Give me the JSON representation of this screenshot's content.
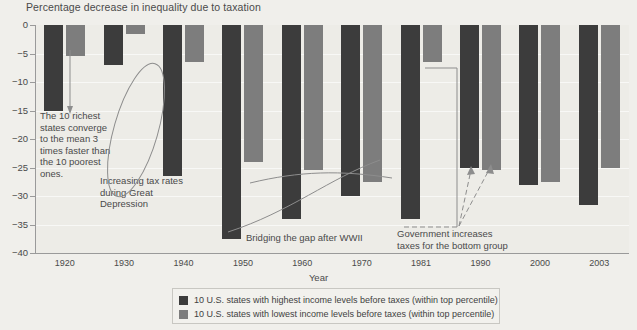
{
  "chart_data": {
    "type": "bar",
    "title": "Percentage decrease in inequality due to taxation",
    "xlabel": "Year",
    "ylabel": "",
    "ylim": [
      -40,
      0
    ],
    "yticks": [
      "0",
      "−5",
      "−10",
      "−15",
      "−20",
      "−25",
      "−30",
      "−35",
      "−40"
    ],
    "ytick_values": [
      0,
      -5,
      -10,
      -15,
      -20,
      -25,
      -30,
      -35,
      -40
    ],
    "grid": true,
    "legend_position": "bottom-center",
    "categories": [
      "1920",
      "1930",
      "1940",
      "1950",
      "1960",
      "1970",
      "1981",
      "1990",
      "2000",
      "2003"
    ],
    "series": [
      {
        "name": "10 U.S. states with highest income levels before taxes (within top percentile)",
        "color": "#3c3c3c",
        "values": [
          -15.0,
          -7.0,
          -26.5,
          -37.5,
          -34.0,
          -30.0,
          -34.0,
          -25.0,
          -28.0,
          -31.5
        ]
      },
      {
        "name": "10 U.S. states with lowest income levels before taxes (within top percentile)",
        "color": "#7d7d7d",
        "values": [
          -5.5,
          -1.5,
          -6.5,
          -24.0,
          -25.5,
          -27.5,
          -6.5,
          -25.5,
          -27.5,
          -25.0
        ]
      }
    ],
    "annotations": [
      {
        "id": "richest-converge",
        "text": "The 10 richest states converge to the mean 3 times faster than the 10 poorest ones."
      },
      {
        "id": "great-depression",
        "text": "Increasing tax rates during Great Depression"
      },
      {
        "id": "bridging-gap",
        "text": "Bridging the gap after WWII"
      },
      {
        "id": "government-increases",
        "text": "Government increases taxes for the bottom group"
      }
    ]
  },
  "annotation_lines": {
    "richest": [
      "The 10 richest",
      "states converge",
      "to the mean 3",
      "times faster than",
      "the 10 poorest",
      "ones."
    ],
    "depression": [
      "Increasing tax rates",
      "during Great",
      "Depression"
    ],
    "wwii": [
      "Bridging the gap after WWII"
    ],
    "government": [
      "Government increases",
      "taxes for the bottom group"
    ]
  },
  "legend": {
    "items": [
      {
        "swatch": "dark",
        "label": "10 U.S. states with highest income levels before taxes (within top percentile)"
      },
      {
        "swatch": "light",
        "label": "10 U.S. states with lowest income levels before taxes (within top percentile)"
      }
    ]
  },
  "colors": {
    "dark_series": "#3c3c3c",
    "light_series": "#7d7d7d",
    "plot_background": "#edece7",
    "page_background": "#f0efeb",
    "gridline": "#f8f8f6",
    "axis": "#9a9a9a",
    "text": "#4a4a4a"
  }
}
